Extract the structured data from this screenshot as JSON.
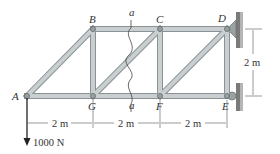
{
  "diagram": {
    "type": "truss",
    "colors": {
      "member_fill": "#c9cfd0",
      "member_edge": "#8a9294",
      "wall": "#7a7a7a",
      "text": "#333333",
      "dimension_line": "#555555",
      "force_arrow": "#222222"
    },
    "nodes": [
      {
        "id": "A",
        "label": "A",
        "x": 27,
        "y": 96
      },
      {
        "id": "B",
        "label": "B",
        "x": 93,
        "y": 29
      },
      {
        "id": "C",
        "label": "C",
        "x": 160,
        "y": 29
      },
      {
        "id": "D",
        "label": "D",
        "x": 227,
        "y": 29
      },
      {
        "id": "E",
        "label": "E",
        "x": 227,
        "y": 96
      },
      {
        "id": "F",
        "label": "F",
        "x": 160,
        "y": 96
      },
      {
        "id": "G",
        "label": "G",
        "x": 93,
        "y": 96
      }
    ],
    "members": [
      [
        "A",
        "B"
      ],
      [
        "A",
        "G"
      ],
      [
        "B",
        "G"
      ],
      [
        "B",
        "C"
      ],
      [
        "G",
        "C"
      ],
      [
        "G",
        "F"
      ],
      [
        "C",
        "F"
      ],
      [
        "C",
        "D"
      ],
      [
        "F",
        "D"
      ],
      [
        "F",
        "E"
      ],
      [
        "D",
        "E"
      ]
    ],
    "section_cut": {
      "label_top": "a",
      "label_bottom": "a"
    },
    "supports": [
      {
        "node": "D",
        "type": "pin-wall"
      },
      {
        "node": "E",
        "type": "roller-wall"
      }
    ],
    "load": {
      "node": "A",
      "label": "1000 N",
      "direction": "down"
    },
    "dimensions": {
      "horizontal": [
        "2 m",
        "2 m",
        "2 m"
      ],
      "vertical": "2 m"
    }
  }
}
